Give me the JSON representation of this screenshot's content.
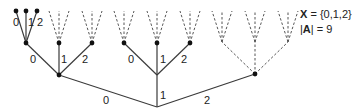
{
  "legend": {
    "set_symbol": "X",
    "set_eq": " = {0,1,2}",
    "card_open": "|",
    "card_symbol": "A",
    "card_close": "|",
    "card_eq": " = 9"
  },
  "labels": {
    "root_0": "0",
    "root_1": "1",
    "root_2": "2",
    "l_0": "0",
    "l_1": "1",
    "l_2": "2",
    "m_0": "0",
    "m_1": "1",
    "m_2": "2",
    "ll_0": "0",
    "ll_1": "1",
    "ll_2": "2"
  },
  "colors": {
    "edge": "#3a3a3a",
    "node": "#111111"
  }
}
